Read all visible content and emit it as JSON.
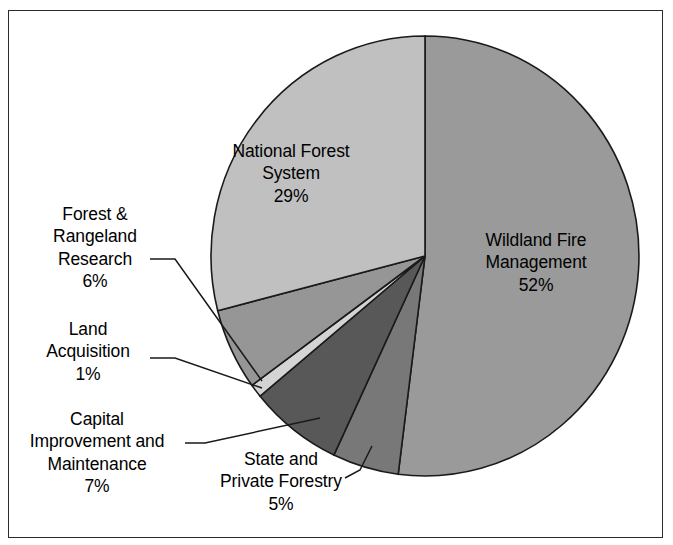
{
  "chart_data": {
    "type": "pie",
    "title": "",
    "subtitle": "",
    "xlabel": "",
    "ylabel": "",
    "legend_position": "none",
    "labels_inside_slice": [
      "Wildland Fire Management",
      "National Forest System"
    ],
    "total_percent": 100,
    "categories": [
      "Wildland Fire Management",
      "State and Private Forestry",
      "Capital Improvement and Maintenance",
      "Land Acquisition",
      "Forest & Rangeland Research",
      "National Forest System"
    ],
    "values": [
      52,
      5,
      7,
      1,
      6,
      29
    ],
    "value_labels": [
      "52%",
      "5%",
      "7%",
      "1%",
      "6%",
      "29%"
    ],
    "slice_colors": [
      "#9a9a9a",
      "#787878",
      "#585858",
      "#d4d4d4",
      "#969696",
      "#c0c0c0"
    ],
    "start_angle_deg": 0,
    "direction": "clockwise",
    "slices": [
      {
        "name": "wildland-fire-management",
        "label": "Wildland Fire Management",
        "label_lines": [
          "Wildland Fire",
          "Management"
        ],
        "percent": 52,
        "percent_text": "52%",
        "color": "#9a9a9a",
        "label_placement": "inside"
      },
      {
        "name": "state-and-private-forestry",
        "label": "State and Private Forestry",
        "label_lines": [
          "State and",
          "Private Forestry"
        ],
        "percent": 5,
        "percent_text": "5%",
        "color": "#787878",
        "label_placement": "callout"
      },
      {
        "name": "capital-improvement-and-maintenance",
        "label": "Capital Improvement and Maintenance",
        "label_lines": [
          "Capital",
          "Improvement and",
          "Maintenance"
        ],
        "percent": 7,
        "percent_text": "7%",
        "color": "#585858",
        "label_placement": "callout"
      },
      {
        "name": "land-acquisition",
        "label": "Land Acquisition",
        "label_lines": [
          "Land",
          "Acquisition"
        ],
        "percent": 1,
        "percent_text": "1%",
        "color": "#d4d4d4",
        "label_placement": "callout"
      },
      {
        "name": "forest-and-rangeland-research",
        "label": "Forest & Rangeland Research",
        "label_lines": [
          "Forest &",
          "Rangeland",
          "Research"
        ],
        "percent": 6,
        "percent_text": "6%",
        "color": "#969696",
        "label_placement": "callout"
      },
      {
        "name": "national-forest-system",
        "label": "National Forest System",
        "label_lines": [
          "National Forest",
          "System"
        ],
        "percent": 29,
        "percent_text": "29%",
        "color": "#c0c0c0",
        "label_placement": "inside"
      }
    ]
  },
  "labels": {
    "national_forest_system": {
      "line1": "National Forest",
      "line2": "System",
      "percent": "29%"
    },
    "wildland_fire": {
      "line1": "Wildland Fire",
      "line2": "Management",
      "percent": "52%"
    },
    "forest_rangeland_research": {
      "line1": "Forest &",
      "line2": "Rangeland",
      "line3": "Research",
      "percent": "6%"
    },
    "land_acquisition": {
      "line1": "Land",
      "line2": "Acquisition",
      "percent": "1%"
    },
    "capital_improvement": {
      "line1": "Capital",
      "line2": "Improvement and",
      "line3": "Maintenance",
      "percent": "7%"
    },
    "state_private_forestry": {
      "line1": "State and",
      "line2": "Private Forestry",
      "percent": "5%"
    }
  },
  "style": {
    "background": "#ffffff",
    "frame_color": "#2b2b2b",
    "slice_outline": "#1a1a1a",
    "leader_line_color": "#1a1a1a",
    "text_color": "#000000"
  }
}
